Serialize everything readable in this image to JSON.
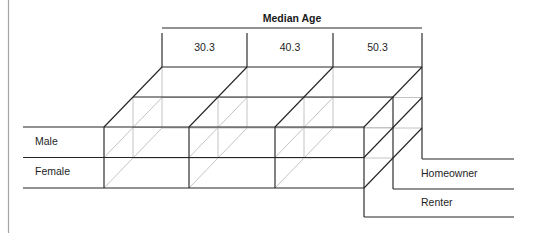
{
  "diagram": {
    "title": "Median Age",
    "columns": [
      "30.3",
      "40.3",
      "50.3"
    ],
    "rows": [
      "Male",
      "Female"
    ],
    "depth": [
      "Homeowner",
      "Renter"
    ]
  }
}
